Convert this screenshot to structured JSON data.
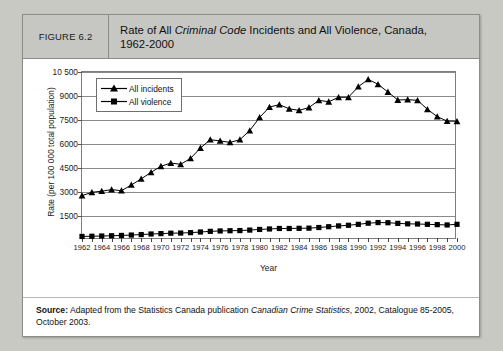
{
  "figure": {
    "number_label": "FIGURE 6.2",
    "title_part1": "Rate of All ",
    "title_italic": "Criminal Code",
    "title_part2": " Incidents and All Violence, Canada,",
    "title_line2": "1962-2000"
  },
  "source": {
    "label": "Source:",
    "text_part1": " Adapted from the Statistics Canada publication ",
    "italic": "Canadian Crime Statistics",
    "text_part2": ", 2002, Catalogue 85-2005, October 2003."
  },
  "chart_data": {
    "type": "line",
    "title": "Rate of All Criminal Code Incidents and All Violence, Canada, 1962-2000",
    "xlabel": "Year",
    "ylabel": "Rate (per 100 000 total population)",
    "ylim": [
      0,
      10500
    ],
    "ytick_values": [
      1500,
      3000,
      4500,
      6000,
      7500,
      9000,
      10500
    ],
    "ytick_labels": [
      "1500",
      "3000",
      "4500",
      "6000",
      "7500",
      "9000",
      "10 500"
    ],
    "xlim": [
      1962,
      2000
    ],
    "xtick_labels": [
      "1962",
      "1964",
      "1966",
      "1968",
      "1970",
      "1972",
      "1974",
      "1976",
      "1978",
      "1980",
      "1982",
      "1984",
      "1986",
      "1988",
      "1990",
      "1992",
      "1994",
      "1996",
      "1998",
      "2000"
    ],
    "grid": true,
    "legend_position": "top-left",
    "x": [
      1962,
      1963,
      1964,
      1965,
      1966,
      1967,
      1968,
      1969,
      1970,
      1971,
      1972,
      1973,
      1974,
      1975,
      1976,
      1977,
      1978,
      1979,
      1980,
      1981,
      1982,
      1983,
      1984,
      1985,
      1986,
      1987,
      1988,
      1989,
      1990,
      1991,
      1992,
      1993,
      1994,
      1995,
      1996,
      1997,
      1998,
      1999,
      2000
    ],
    "series": [
      {
        "name": "All incidents",
        "marker": "triangle",
        "color": "#000000",
        "values": [
          2771,
          2980,
          3050,
          3150,
          3080,
          3440,
          3820,
          4230,
          4610,
          4810,
          4730,
          5100,
          5750,
          6270,
          6190,
          6100,
          6270,
          6840,
          7660,
          8310,
          8460,
          8200,
          8100,
          8280,
          8730,
          8640,
          8920,
          8920,
          9580,
          10040,
          9730,
          9250,
          8750,
          8770,
          8730,
          8170,
          7710,
          7430,
          7420
        ]
      },
      {
        "name": "All violence",
        "marker": "square",
        "color": "#000000",
        "values": [
          221,
          235,
          250,
          265,
          285,
          310,
          340,
          375,
          400,
          425,
          435,
          460,
          500,
          540,
          565,
          580,
          590,
          620,
          660,
          690,
          720,
          720,
          730,
          740,
          780,
          830,
          880,
          920,
          980,
          1050,
          1090,
          1080,
          1040,
          1010,
          1000,
          980,
          960,
          940,
          980
        ]
      }
    ]
  }
}
